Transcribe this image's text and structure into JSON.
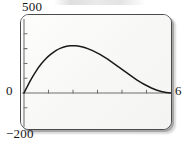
{
  "window": {
    "kind": "graphing-calculator-screen",
    "frame_style": "rounded-rectangle-with-drop-shadow"
  },
  "labels": {
    "y_max": "500",
    "y_min": "−200",
    "origin": "0",
    "x_max": "6"
  },
  "colors": {
    "curve": "#1a1a1a",
    "axis": "#6f6f6f",
    "frame_border": "#4a4a4a",
    "screen_background": "#fbfbfa",
    "label_text": "#161616",
    "shadow": "#7d7d7d"
  },
  "chart_data": {
    "type": "line",
    "title": "",
    "subtitle": "",
    "xlabel": "",
    "ylabel": "",
    "xlim": [
      0,
      6
    ],
    "ylim": [
      -200,
      500
    ],
    "grid": false,
    "legend": null,
    "legend_position": "none",
    "x_tick_labels": [
      "0",
      "6"
    ],
    "y_tick_labels": [
      "500",
      "−200"
    ],
    "x_ticks_unlabeled": [
      1,
      2,
      3,
      4,
      5
    ],
    "y_ticks_unlabeled": [
      -100,
      100,
      200,
      300,
      400
    ],
    "annotations": [],
    "series": [
      {
        "name": "curve",
        "x": [
          0,
          0.2,
          0.4,
          0.6,
          0.8,
          1.0,
          1.2,
          1.4,
          1.6,
          1.8,
          2.0,
          2.2,
          2.4,
          2.6,
          2.8,
          3.0,
          3.2,
          3.4,
          3.6,
          3.8,
          4.0,
          4.2,
          4.4,
          4.6,
          4.8,
          5.0,
          5.2,
          5.4,
          5.6,
          5.8,
          6.0
        ],
        "y": [
          0,
          67,
          125,
          175,
          216,
          250,
          276,
          297,
          310,
          318,
          320,
          317,
          311,
          300,
          286,
          270,
          251,
          230,
          207,
          184,
          160,
          136,
          112,
          89,
          68,
          50,
          34,
          20,
          10,
          3,
          0
        ],
        "description": "smooth cubic-like hump rising from the origin to a maximum of about 320 near x = 2.0 and returning to zero at x = 6"
      }
    ]
  }
}
